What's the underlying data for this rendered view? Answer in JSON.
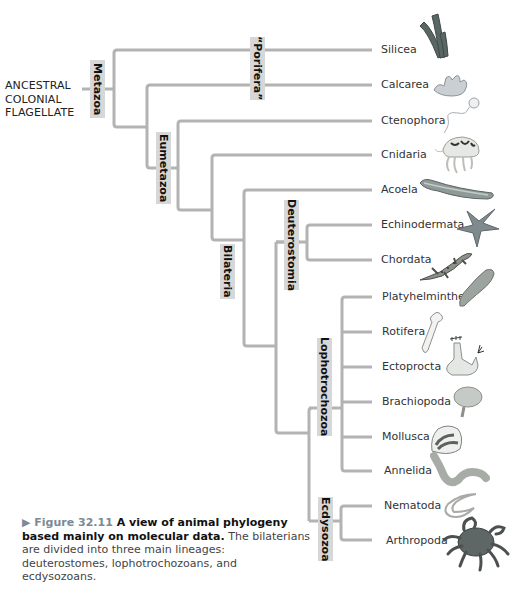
{
  "root": {
    "lines": [
      "ANCESTRAL",
      "COLONIAL",
      "FLAGELLATE"
    ]
  },
  "clades": {
    "metazoa": "Metazoa",
    "porifera": "“Porifera”",
    "eumetazoa": "Eumetazoa",
    "bilateria": "Bilateria",
    "deuterostomia": "Deuterostomia",
    "lophotrochozoa": "Lophotrochozoa",
    "ecdysozoa": "Ecdysozoa"
  },
  "taxa": [
    {
      "name": "Silicea",
      "icon": "sponge-tubes-icon"
    },
    {
      "name": "Calcarea",
      "icon": "calcareous-sponge-icon"
    },
    {
      "name": "Ctenophora",
      "icon": "comb-jelly-icon"
    },
    {
      "name": "Cnidaria",
      "icon": "jellyfish-icon"
    },
    {
      "name": "Acoela",
      "icon": "flatworm-acoel-icon"
    },
    {
      "name": "Echinodermata",
      "icon": "sea-star-icon"
    },
    {
      "name": "Chordata",
      "icon": "salamander-icon"
    },
    {
      "name": "Platyhelminthes",
      "icon": "flatworm-icon"
    },
    {
      "name": "Rotifera",
      "icon": "rotifer-icon"
    },
    {
      "name": "Ectoprocta",
      "icon": "bryozoan-icon"
    },
    {
      "name": "Brachiopoda",
      "icon": "lamp-shell-icon"
    },
    {
      "name": "Mollusca",
      "icon": "clam-shell-icon"
    },
    {
      "name": "Annelida",
      "icon": "segmented-worm-icon"
    },
    {
      "name": "Nematoda",
      "icon": "roundworm-icon"
    },
    {
      "name": "Arthropoda",
      "icon": "crab-icon"
    }
  ],
  "caption": {
    "figure": "▶ Figure 32.11",
    "title": " A view of animal phylogeny based mainly on molecular data.",
    "text": " The bilaterians are divided into three main lineages: deuterostomes, lophotrochozoans, and ecdysozoans."
  },
  "colors": {
    "branch": "#b3b3b3",
    "clade_box": "#d7d7d7"
  }
}
